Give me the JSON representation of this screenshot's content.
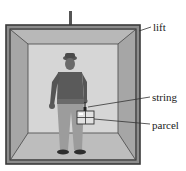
{
  "diagram": {
    "labels": {
      "lift": "lift",
      "string": "string",
      "parcel": "parcel"
    },
    "colors": {
      "frame": "#3a3a3a",
      "side_wall": "#a9a9a9",
      "ceiling": "#b8b8b8",
      "back_wall": "#d4d4d4",
      "floor": "#bdbdbd",
      "figure_dark": "#4a4a4a",
      "figure_mid": "#7a7a7a",
      "trousers": "#9a9a9a",
      "leader": "#333333"
    }
  }
}
